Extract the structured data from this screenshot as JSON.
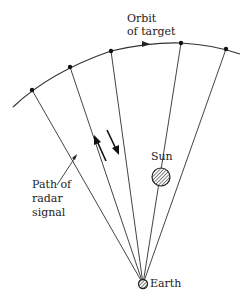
{
  "diagram": {
    "labels": {
      "orbit_line1": "Orbit",
      "orbit_line2": "of target",
      "sun": "Sun",
      "earth": "Earth",
      "path_line1": "Path of",
      "path_line2": "radar",
      "path_line3": "signal"
    },
    "colors": {
      "line": "#333333",
      "fill_hatch": "#555555"
    },
    "earth": {
      "x": 143,
      "y": 284
    },
    "target_points": [
      {
        "x": 32,
        "y": 90
      },
      {
        "x": 70,
        "y": 67
      },
      {
        "x": 111,
        "y": 51
      },
      {
        "x": 181,
        "y": 43
      },
      {
        "x": 226,
        "y": 49
      }
    ]
  }
}
